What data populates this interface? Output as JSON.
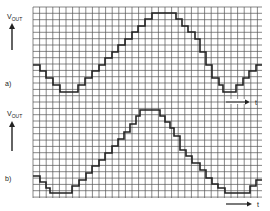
{
  "figure": {
    "grid": {
      "x0": 33,
      "y0": 7,
      "x1": 262,
      "y1": 198,
      "cell": 6.6,
      "color": "#555555"
    },
    "waveform_color": "#222222",
    "panels": [
      {
        "id": "a",
        "label": "a)",
        "y_axis_label": "V",
        "y_axis_sub": "OUT",
        "x_axis_label": "t",
        "step_points": [
          [
            33,
            65
          ],
          [
            40,
            65
          ],
          [
            40,
            71
          ],
          [
            46,
            71
          ],
          [
            46,
            78
          ],
          [
            53,
            78
          ],
          [
            53,
            85
          ],
          [
            60,
            85
          ],
          [
            60,
            92
          ],
          [
            78,
            92
          ],
          [
            78,
            85
          ],
          [
            85,
            85
          ],
          [
            85,
            78
          ],
          [
            92,
            78
          ],
          [
            92,
            71
          ],
          [
            99,
            71
          ],
          [
            99,
            65
          ],
          [
            105,
            65
          ],
          [
            105,
            58
          ],
          [
            112,
            58
          ],
          [
            112,
            52
          ],
          [
            118,
            52
          ],
          [
            118,
            45
          ],
          [
            125,
            45
          ],
          [
            125,
            39
          ],
          [
            132,
            39
          ],
          [
            132,
            32
          ],
          [
            138,
            32
          ],
          [
            138,
            26
          ],
          [
            145,
            26
          ],
          [
            145,
            19
          ],
          [
            152,
            19
          ],
          [
            152,
            13
          ],
          [
            176,
            13
          ],
          [
            176,
            19
          ],
          [
            182,
            19
          ],
          [
            182,
            26
          ],
          [
            188,
            26
          ],
          [
            188,
            32
          ],
          [
            195,
            32
          ],
          [
            195,
            39
          ],
          [
            200,
            39
          ],
          [
            200,
            52
          ],
          [
            206,
            52
          ],
          [
            206,
            65
          ],
          [
            212,
            65
          ],
          [
            212,
            78
          ],
          [
            219,
            78
          ],
          [
            219,
            85
          ],
          [
            223,
            85
          ],
          [
            223,
            92
          ],
          [
            236,
            92
          ],
          [
            236,
            85
          ],
          [
            243,
            85
          ],
          [
            243,
            78
          ],
          [
            249,
            78
          ],
          [
            249,
            71
          ],
          [
            256,
            71
          ],
          [
            256,
            65
          ],
          [
            262,
            65
          ]
        ]
      },
      {
        "id": "b",
        "label": "b)",
        "y_axis_label": "V",
        "y_axis_sub": "OUT",
        "x_axis_label": "t",
        "step_points": [
          [
            33,
            176
          ],
          [
            40,
            176
          ],
          [
            40,
            182
          ],
          [
            46,
            182
          ],
          [
            46,
            188
          ],
          [
            50,
            188
          ],
          [
            50,
            193
          ],
          [
            72,
            193
          ],
          [
            72,
            186
          ],
          [
            79,
            186
          ],
          [
            79,
            180
          ],
          [
            86,
            180
          ],
          [
            86,
            173
          ],
          [
            92,
            173
          ],
          [
            92,
            166
          ],
          [
            99,
            166
          ],
          [
            99,
            160
          ],
          [
            105,
            160
          ],
          [
            105,
            153
          ],
          [
            112,
            153
          ],
          [
            112,
            146
          ],
          [
            118,
            146
          ],
          [
            118,
            139
          ],
          [
            124,
            139
          ],
          [
            124,
            132
          ],
          [
            130,
            132
          ],
          [
            130,
            124
          ],
          [
            136,
            124
          ],
          [
            136,
            116
          ],
          [
            140,
            116
          ],
          [
            140,
            110
          ],
          [
            160,
            110
          ],
          [
            160,
            116
          ],
          [
            165,
            116
          ],
          [
            165,
            122
          ],
          [
            170,
            122
          ],
          [
            170,
            128
          ],
          [
            174,
            128
          ],
          [
            174,
            136
          ],
          [
            180,
            136
          ],
          [
            180,
            150
          ],
          [
            186,
            150
          ],
          [
            186,
            156
          ],
          [
            192,
            156
          ],
          [
            192,
            163
          ],
          [
            200,
            163
          ],
          [
            200,
            170
          ],
          [
            206,
            170
          ],
          [
            206,
            178
          ],
          [
            212,
            178
          ],
          [
            212,
            184
          ],
          [
            218,
            184
          ],
          [
            218,
            188
          ],
          [
            225,
            188
          ],
          [
            225,
            193
          ],
          [
            250,
            193
          ],
          [
            250,
            186
          ],
          [
            256,
            186
          ],
          [
            256,
            180
          ],
          [
            262,
            180
          ]
        ]
      }
    ]
  }
}
